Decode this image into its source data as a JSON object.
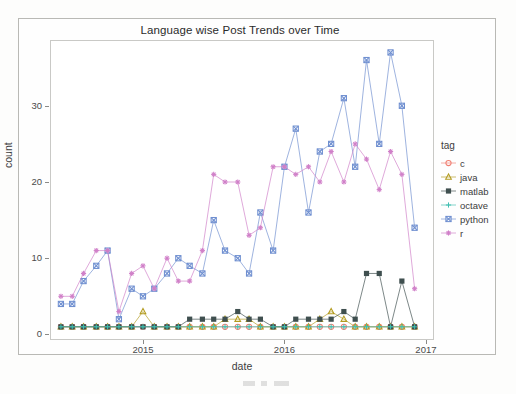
{
  "chart_data": {
    "type": "line",
    "title": "Language wise Post Trends over Time",
    "xlabel": "date",
    "ylabel": "count",
    "xlim": [
      2014.35,
      2017.05
    ],
    "ylim": [
      -0.6,
      38.5
    ],
    "xticks": [
      "2015",
      "2016",
      "2017"
    ],
    "xtick_values": [
      2015,
      2016,
      2017
    ],
    "yticks": [
      "0",
      "10",
      "20",
      "30"
    ],
    "ytick_values": [
      0,
      10,
      20,
      30
    ],
    "grid": false,
    "legend": {
      "title": "tag",
      "position": "right",
      "entries": [
        {
          "label": "c",
          "shape": "circle",
          "color": "#f07f72"
        },
        {
          "label": "java",
          "shape": "triangle",
          "color": "#b39b20"
        },
        {
          "label": "matlab",
          "shape": "square",
          "color": "#3f4f4f"
        },
        {
          "label": "octave",
          "shape": "plus",
          "color": "#3fbfb0"
        },
        {
          "label": "python",
          "shape": "square-cross",
          "color": "#6f8fd0"
        },
        {
          "label": "r",
          "shape": "asterisk",
          "color": "#d07fc8"
        }
      ]
    },
    "series": [
      {
        "name": "c",
        "color": "#f07f72",
        "shape": "circle",
        "x": [
          2014.42,
          2014.5,
          2014.58,
          2014.67,
          2014.75,
          2014.83,
          2014.92,
          2015.0,
          2015.08,
          2015.17,
          2015.25,
          2015.33,
          2015.42,
          2015.5,
          2015.58,
          2015.67,
          2015.75,
          2015.83,
          2015.92,
          2016.0,
          2016.08,
          2016.17,
          2016.25,
          2016.33,
          2016.42,
          2016.5,
          2016.58,
          2016.67,
          2016.75,
          2016.83,
          2016.92
        ],
        "y": [
          1,
          1,
          1,
          1,
          1,
          1,
          1,
          1,
          1,
          1,
          1,
          1,
          1,
          1,
          1,
          1,
          1,
          1,
          1,
          1,
          1,
          1,
          1,
          1,
          1,
          1,
          1,
          1,
          1,
          1,
          1
        ]
      },
      {
        "name": "java",
        "color": "#b39b20",
        "shape": "triangle",
        "x": [
          2014.42,
          2014.5,
          2014.58,
          2014.67,
          2014.75,
          2014.83,
          2014.92,
          2015.0,
          2015.08,
          2015.17,
          2015.25,
          2015.33,
          2015.42,
          2015.5,
          2015.58,
          2015.67,
          2015.75,
          2015.83,
          2015.92,
          2016.0,
          2016.08,
          2016.17,
          2016.25,
          2016.33,
          2016.42,
          2016.5,
          2016.58,
          2016.67,
          2016.75,
          2016.83,
          2016.92
        ],
        "y": [
          1,
          1,
          1,
          1,
          1,
          1,
          1,
          3,
          1,
          1,
          1,
          1,
          1,
          1,
          2,
          2,
          2,
          1,
          1,
          1,
          1,
          1,
          2,
          3,
          2,
          1,
          1,
          1,
          1,
          1,
          1
        ]
      },
      {
        "name": "matlab",
        "color": "#3f4f4f",
        "shape": "square",
        "x": [
          2014.42,
          2014.5,
          2014.58,
          2014.67,
          2014.75,
          2014.83,
          2014.92,
          2015.0,
          2015.08,
          2015.17,
          2015.25,
          2015.33,
          2015.42,
          2015.5,
          2015.58,
          2015.67,
          2015.75,
          2015.83,
          2015.92,
          2016.0,
          2016.08,
          2016.17,
          2016.25,
          2016.33,
          2016.42,
          2016.5,
          2016.58,
          2016.67,
          2016.75,
          2016.83,
          2016.92
        ],
        "y": [
          1,
          1,
          1,
          1,
          1,
          1,
          1,
          1,
          1,
          1,
          1,
          2,
          2,
          2,
          2,
          3,
          2,
          2,
          1,
          1,
          2,
          2,
          2,
          2,
          3,
          2,
          8,
          8,
          1,
          7,
          1
        ]
      },
      {
        "name": "octave",
        "color": "#3fbfb0",
        "shape": "plus",
        "x": [
          2014.42,
          2014.5,
          2014.58,
          2014.67,
          2014.75,
          2014.83,
          2014.92,
          2015.0,
          2015.08,
          2015.17,
          2015.25,
          2015.33,
          2015.42,
          2015.5,
          2015.58,
          2015.67,
          2015.75,
          2015.83,
          2015.92,
          2016.0,
          2016.08,
          2016.17,
          2016.25,
          2016.33,
          2016.42,
          2016.5,
          2016.58,
          2016.67,
          2016.75,
          2016.83,
          2016.92
        ],
        "y": [
          1,
          1,
          1,
          1,
          1,
          1,
          1,
          1,
          1,
          1,
          1,
          1,
          1,
          1,
          1,
          1,
          1,
          1,
          1,
          1,
          1,
          1,
          1,
          1,
          1,
          1,
          1,
          1,
          1,
          1,
          1
        ]
      },
      {
        "name": "python",
        "color": "#6f8fd0",
        "shape": "square-cross",
        "x": [
          2014.42,
          2014.5,
          2014.58,
          2014.67,
          2014.75,
          2014.83,
          2014.92,
          2015.0,
          2015.08,
          2015.17,
          2015.25,
          2015.33,
          2015.42,
          2015.5,
          2015.58,
          2015.67,
          2015.75,
          2015.83,
          2015.92,
          2016.0,
          2016.08,
          2016.17,
          2016.25,
          2016.33,
          2016.42,
          2016.5,
          2016.58,
          2016.67,
          2016.75,
          2016.83,
          2016.92
        ],
        "y": [
          4,
          4,
          7,
          9,
          11,
          2,
          6,
          5,
          6,
          8,
          10,
          9,
          8,
          15,
          11,
          10,
          8,
          16,
          11,
          22,
          27,
          16,
          24,
          25,
          31,
          22,
          36,
          25,
          37,
          30,
          14
        ]
      },
      {
        "name": "r",
        "color": "#d07fc8",
        "shape": "asterisk",
        "x": [
          2014.42,
          2014.5,
          2014.58,
          2014.67,
          2014.75,
          2014.83,
          2014.92,
          2015.0,
          2015.08,
          2015.17,
          2015.25,
          2015.33,
          2015.42,
          2015.5,
          2015.58,
          2015.67,
          2015.75,
          2015.83,
          2015.92,
          2016.0,
          2016.08,
          2016.17,
          2016.25,
          2016.33,
          2016.42,
          2016.5,
          2016.58,
          2016.67,
          2016.75,
          2016.83,
          2016.92
        ],
        "y": [
          5,
          5,
          8,
          11,
          11,
          3,
          8,
          9,
          6,
          10,
          7,
          7,
          11,
          21,
          20,
          20,
          13,
          14,
          22,
          22,
          21,
          22,
          20,
          24,
          20,
          25,
          23,
          19,
          24,
          21,
          6
        ]
      }
    ]
  }
}
